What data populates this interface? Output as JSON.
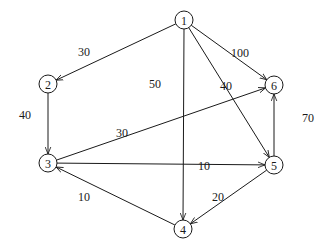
{
  "diagram": {
    "type": "directed-weighted-graph",
    "node_radius": 9,
    "colors": {
      "stroke": "#1a1a1a",
      "background": "#ffffff"
    },
    "nodes": [
      {
        "id": "1",
        "label": "1",
        "x": 184,
        "y": 20
      },
      {
        "id": "2",
        "label": "2",
        "x": 48,
        "y": 84
      },
      {
        "id": "3",
        "label": "3",
        "x": 48,
        "y": 163
      },
      {
        "id": "4",
        "label": "4",
        "x": 183,
        "y": 229
      },
      {
        "id": "5",
        "label": "5",
        "x": 274,
        "y": 165
      },
      {
        "id": "6",
        "label": "6",
        "x": 274,
        "y": 85
      }
    ],
    "edges": [
      {
        "from": "1",
        "to": "2",
        "weight": "30",
        "label_x": 84,
        "label_y": 52
      },
      {
        "from": "1",
        "to": "4",
        "weight": "50",
        "label_x": 155,
        "label_y": 84
      },
      {
        "from": "1",
        "to": "5",
        "weight": "40",
        "label_x": 226,
        "label_y": 86
      },
      {
        "from": "1",
        "to": "6",
        "weight": "100",
        "label_x": 240,
        "label_y": 53
      },
      {
        "from": "2",
        "to": "3",
        "weight": "40",
        "label_x": 25,
        "label_y": 115
      },
      {
        "from": "3",
        "to": "6",
        "weight": "30",
        "label_x": 122,
        "label_y": 133
      },
      {
        "from": "3",
        "to": "5",
        "weight": "10",
        "label_x": 204,
        "label_y": 166
      },
      {
        "from": "4",
        "to": "3",
        "weight": "10",
        "label_x": 84,
        "label_y": 197
      },
      {
        "from": "5",
        "to": "4",
        "weight": "20",
        "label_x": 218,
        "label_y": 197
      },
      {
        "from": "5",
        "to": "6",
        "weight": "70",
        "label_x": 308,
        "label_y": 118
      }
    ]
  }
}
